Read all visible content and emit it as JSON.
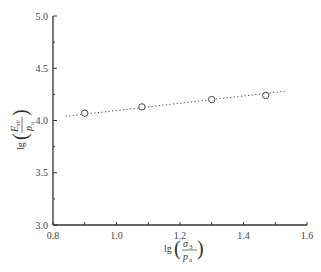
{
  "chart_data": {
    "type": "scatter",
    "title": "",
    "xlabel": "lg(σ3/pa)",
    "ylabel": "lg(Esv/pa)",
    "xlim": [
      0.8,
      1.6
    ],
    "ylim": [
      3.0,
      5.0
    ],
    "grid": false,
    "legend": null,
    "x_ticks": [
      0.8,
      1.0,
      1.2,
      1.4,
      1.6
    ],
    "x_tick_labels": [
      "0.8",
      "1.0",
      "1.2",
      "1.4",
      "1.6"
    ],
    "y_ticks": [
      3.0,
      3.5,
      4.0,
      4.5,
      5.0
    ],
    "y_tick_labels": [
      "3.0",
      "3.5",
      "4.0",
      "4.5",
      "5.0"
    ],
    "series": [
      {
        "name": "measured",
        "marker": "open-circle",
        "x": [
          0.9,
          1.08,
          1.3,
          1.47
        ],
        "y": [
          4.07,
          4.13,
          4.2,
          4.24
        ]
      },
      {
        "name": "fit",
        "style": "dotted-line",
        "x": [
          0.84,
          1.53
        ],
        "y": [
          4.04,
          4.28
        ]
      }
    ]
  },
  "labels": {
    "xlabel_prefix": "lg",
    "xlabel_num": "σ",
    "xlabel_num_sub": "3",
    "xlabel_den": "p",
    "xlabel_den_sub": "a",
    "ylabel_prefix": "lg",
    "ylabel_num": "E",
    "ylabel_num_sub": "sv",
    "ylabel_den": "p",
    "ylabel_den_sub": "a"
  }
}
